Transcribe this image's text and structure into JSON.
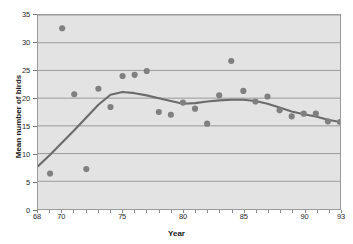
{
  "chart_data": {
    "type": "scatter",
    "title": "",
    "xlabel": "Year",
    "ylabel": "Mean number of birds",
    "xlim": [
      68,
      93
    ],
    "ylim": [
      0,
      35
    ],
    "grid": true,
    "legend": "none",
    "x_ticks": [
      68,
      70,
      75,
      80,
      85,
      90,
      93
    ],
    "x_tick_labels": [
      "68",
      "70",
      "75",
      "80",
      "85",
      "90",
      "93"
    ],
    "x_minor_ticks": [
      69,
      71,
      72,
      73,
      74,
      76,
      77,
      78,
      79,
      81,
      82,
      83,
      84,
      86,
      87,
      88,
      89,
      91,
      92
    ],
    "y_ticks": [
      0,
      5,
      10,
      15,
      20,
      25,
      30,
      35
    ],
    "y_tick_labels": [
      "0",
      "5",
      "10",
      "15",
      "20",
      "25",
      "30",
      "35"
    ],
    "series": [
      {
        "name": "Mean number of birds",
        "type": "scatter",
        "marker": "circle",
        "color": "#808080",
        "x": [
          69,
          70,
          71,
          72,
          73,
          74,
          75,
          76,
          77,
          78,
          79,
          80,
          81,
          82,
          83,
          84,
          85,
          86,
          87,
          88,
          89,
          90,
          91,
          92,
          93
        ],
        "values": [
          6.4,
          32.6,
          20.7,
          7.2,
          21.7,
          18.4,
          24.0,
          24.2,
          24.9,
          17.5,
          17.0,
          19.2,
          18.1,
          15.4,
          20.5,
          26.7,
          21.3,
          19.4,
          20.3,
          17.8,
          16.7,
          17.2,
          17.2,
          15.8,
          15.7
        ]
      },
      {
        "name": "Smoothed trend",
        "type": "line",
        "color": "#6b6b6b",
        "x": [
          68,
          69,
          70,
          71,
          72,
          73,
          74,
          75,
          76,
          77,
          78,
          79,
          80,
          81,
          82,
          83,
          84,
          85,
          86,
          87,
          88,
          89,
          90,
          91,
          92,
          93
        ],
        "values": [
          7.7,
          9.8,
          12.0,
          14.2,
          16.5,
          18.8,
          20.6,
          21.1,
          20.9,
          20.5,
          20.0,
          19.5,
          19.0,
          19.1,
          19.4,
          19.6,
          19.7,
          19.7,
          19.5,
          19.0,
          18.3,
          17.6,
          17.1,
          16.7,
          16.1,
          15.7
        ]
      }
    ]
  },
  "style": {
    "plot_background": "#e3e3e3",
    "grid_color": "#9a9a9a",
    "marker_color": "#808080",
    "line_color": "#6b6b6b",
    "axis_text_color": "#2a2a2a",
    "title_color": "#1a1a1a"
  }
}
